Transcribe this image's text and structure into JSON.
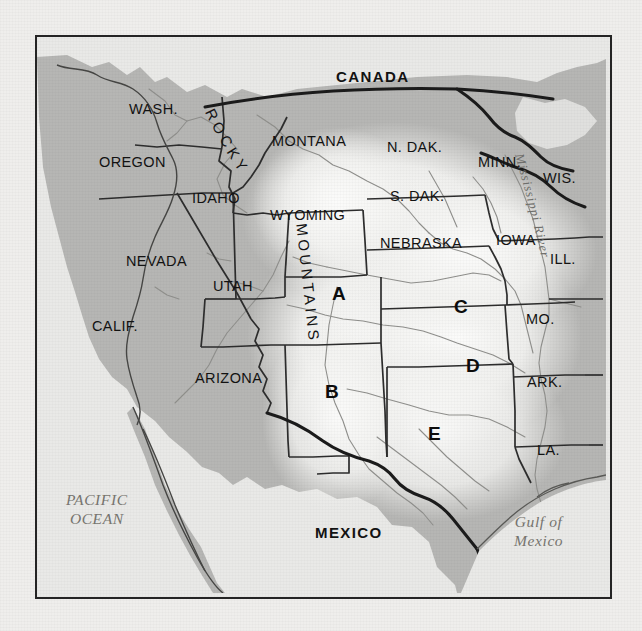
{
  "map": {
    "title": "Western United States physical-political map",
    "frame": {
      "x": 35,
      "y": 35,
      "width": 573,
      "height": 560
    },
    "colors": {
      "paper": "#efeeec",
      "land": "#b6b6b4",
      "highlight": "#f2f2f0",
      "water": "#e9e9e7",
      "border_heavy": "#1d1d1d",
      "border_state": "#2a2a2a",
      "river": "#8d8d8a",
      "label": "#121212",
      "water_label": "#77756f"
    },
    "countries": [
      {
        "name": "CANADA",
        "x": 334,
        "y": 66
      },
      {
        "name": "MEXICO",
        "x": 313,
        "y": 522
      }
    ],
    "states": [
      {
        "name": "WASH.",
        "x": 127,
        "y": 99,
        "size": "lg"
      },
      {
        "name": "OREGON",
        "x": 97,
        "y": 152,
        "size": "lg"
      },
      {
        "name": "IDAHO",
        "x": 190,
        "y": 188,
        "size": "lg"
      },
      {
        "name": "MONTANA",
        "x": 270,
        "y": 131,
        "size": "lg"
      },
      {
        "name": "WYOMING",
        "x": 268,
        "y": 205,
        "size": "lg"
      },
      {
        "name": "NEVADA",
        "x": 124,
        "y": 251,
        "size": "lg"
      },
      {
        "name": "UTAH",
        "x": 211,
        "y": 276,
        "size": "lg"
      },
      {
        "name": "CALIF.",
        "x": 90,
        "y": 316,
        "size": "lg"
      },
      {
        "name": "ARIZONA",
        "x": 193,
        "y": 368,
        "size": "lg"
      },
      {
        "name": "N. DAK.",
        "x": 385,
        "y": 137,
        "size": "lg"
      },
      {
        "name": "S. DAK.",
        "x": 388,
        "y": 186,
        "size": "lg"
      },
      {
        "name": "NEBRASKA",
        "x": 378,
        "y": 233,
        "size": "lg"
      },
      {
        "name": "MINN.",
        "x": 476,
        "y": 152,
        "size": "lg"
      },
      {
        "name": "WIS.",
        "x": 541,
        "y": 168,
        "size": "lg"
      },
      {
        "name": "IOWA",
        "x": 494,
        "y": 230,
        "size": "lg"
      },
      {
        "name": "ILL.",
        "x": 548,
        "y": 249,
        "size": "lg"
      },
      {
        "name": "MO.",
        "x": 524,
        "y": 309,
        "size": "lg"
      },
      {
        "name": "ARK.",
        "x": 525,
        "y": 372,
        "size": "lg"
      },
      {
        "name": "LA.",
        "x": 535,
        "y": 440,
        "size": "lg"
      }
    ],
    "markers": [
      {
        "letter": "A",
        "x": 330,
        "y": 283
      },
      {
        "letter": "B",
        "x": 323,
        "y": 381
      },
      {
        "letter": "C",
        "x": 452,
        "y": 296
      },
      {
        "letter": "D",
        "x": 464,
        "y": 355
      },
      {
        "letter": "E",
        "x": 426,
        "y": 423
      }
    ],
    "water_bodies": [
      {
        "name": "PACIFIC\nOCEAN",
        "lines": [
          "PACIFIC",
          "OCEAN"
        ],
        "x": 64,
        "y": 498
      },
      {
        "name": "Gulf of Mexico",
        "lines": [
          "Gulf of",
          "Mexico"
        ],
        "x": 512,
        "y": 520
      }
    ],
    "mountain_range": {
      "word1": "ROCKY",
      "word2": "MOUNTAINS",
      "word1_chars": [
        "R",
        "O",
        "C",
        "K",
        "Y"
      ],
      "word2_chars": [
        "M",
        "O",
        "U",
        "N",
        "T",
        "A",
        "I",
        "N",
        "S"
      ]
    },
    "rivers": [
      {
        "name": "Mississippi River",
        "chars": [
          "M",
          "i",
          "s",
          "s",
          "i",
          "s",
          "s",
          "i",
          "p",
          "p",
          "i",
          " ",
          "R",
          "i",
          "v",
          "e",
          "r"
        ]
      }
    ]
  }
}
